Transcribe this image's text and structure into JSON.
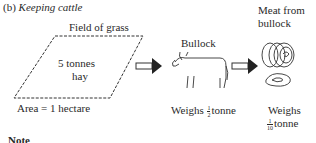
{
  "heading": {
    "prefix": "(b)",
    "title": "Keeping cattle"
  },
  "field": {
    "title": "Field of grass",
    "content_line1": "5 tonnes",
    "content_line2": "hay",
    "area": "Area = 1 hectare"
  },
  "bullock": {
    "title": "Bullock",
    "weight_prefix": "Weighs",
    "weight_num": "1",
    "weight_den": "2",
    "weight_unit": "tonne"
  },
  "meat": {
    "title_line1": "Meat from",
    "title_line2": "bullock",
    "weight_prefix": "Weighs",
    "weight_num": "1",
    "weight_den": "10",
    "weight_unit": "tonne"
  },
  "note": {
    "label": "Note"
  }
}
